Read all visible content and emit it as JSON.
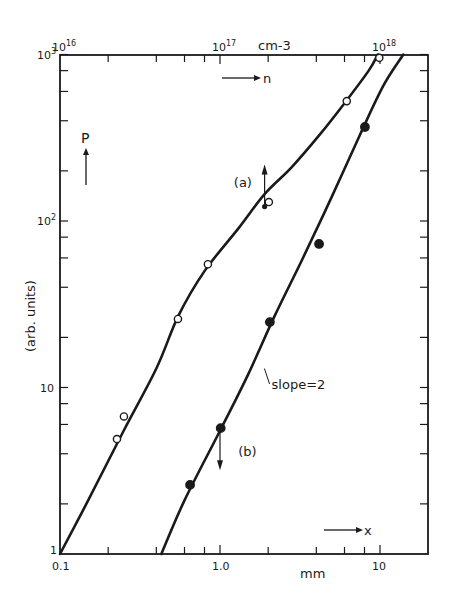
{
  "chart_data": {
    "type": "scatter",
    "title": "",
    "xlabel": "mm",
    "x_axis_arrow_label": "x",
    "x2label": "cm-3",
    "x2_axis_arrow_label": "n",
    "ylabel": "(arb. units)",
    "y_axis_arrow_label": "P",
    "xscale": "log",
    "yscale": "log",
    "xlim": [
      0.1,
      20
    ],
    "ylim": [
      1,
      1000
    ],
    "x2lim": [
      1e+16,
      2e+18
    ],
    "grid": false,
    "legend": "none",
    "x_ticks": [
      {
        "value": 0.1,
        "label": "0.1"
      },
      {
        "value": 1.0,
        "label": "1.0"
      },
      {
        "value": 10,
        "label": "10"
      }
    ],
    "x2_ticks": [
      {
        "value": 0.1,
        "label": "10",
        "exp": "16"
      },
      {
        "value": 1.0,
        "label": "10",
        "exp": "17"
      },
      {
        "value": 10,
        "label": "10",
        "exp": "18"
      }
    ],
    "y_ticks": [
      {
        "value": 1,
        "label": "1",
        "exp": ""
      },
      {
        "value": 10,
        "label": "10",
        "exp": ""
      },
      {
        "value": 100,
        "label": "10",
        "exp": "2"
      },
      {
        "value": 1000,
        "label": "10",
        "exp": "3"
      }
    ],
    "series": [
      {
        "name": "(a)",
        "marker": "open-circle",
        "x": [
          0.227,
          0.251,
          0.546,
          0.84,
          2.02,
          6.2,
          9.9
        ],
        "y": [
          4.9,
          6.7,
          25.8,
          55,
          130,
          525,
          955
        ],
        "curve": [
          [
            0.1,
            1
          ],
          [
            0.15,
            2.1
          ],
          [
            0.25,
            5.5
          ],
          [
            0.4,
            13
          ],
          [
            0.55,
            27
          ],
          [
            0.8,
            50
          ],
          [
            1.3,
            90
          ],
          [
            1.9,
            145
          ],
          [
            2.8,
            210
          ],
          [
            4.2,
            330
          ],
          [
            6.0,
            510
          ],
          [
            8.5,
            800
          ],
          [
            9.7,
            1000
          ]
        ],
        "arrow_marker": {
          "x": 1.9,
          "y": 122,
          "direction": "up"
        }
      },
      {
        "name": "(b)",
        "marker": "filled-circle",
        "x": [
          0.65,
          1.01,
          2.05,
          4.16,
          8.05
        ],
        "y": [
          2.6,
          5.7,
          24.7,
          72.8,
          367
        ],
        "curve": [
          [
            0.43,
            1
          ],
          [
            0.6,
            2.1
          ],
          [
            1.0,
            5.5
          ],
          [
            1.5,
            12
          ],
          [
            2.2,
            27
          ],
          [
            3.3,
            60
          ],
          [
            5.0,
            140
          ],
          [
            7.5,
            330
          ],
          [
            10.5,
            650
          ],
          [
            14,
            1000
          ]
        ],
        "arrow_marker": {
          "x": 1.0,
          "y": 5.7,
          "direction": "down"
        }
      }
    ],
    "annotations": [
      {
        "text": "(a)",
        "x": 1.22,
        "y": 160
      },
      {
        "text": "(b)",
        "x": 1.3,
        "y": 3.9
      },
      {
        "text": "slope=2",
        "x": 2.1,
        "y": 9.8
      }
    ]
  }
}
